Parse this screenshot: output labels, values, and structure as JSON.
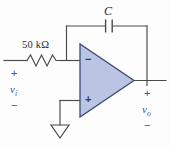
{
  "figure": {
    "background_color": "#fdfdfd"
  },
  "colors": {
    "wire": "#4a4a4a",
    "opamp_fill": "#b9c5e2",
    "opamp_stroke": "#3d4a78",
    "signal_label": "#4a4f9c",
    "component_label": "#2b2b2b"
  },
  "components": {
    "resistor": {
      "name": "input-resistor",
      "label": "50 kΩ",
      "value": "50",
      "unit": "kΩ"
    },
    "capacitor": {
      "name": "feedback-capacitor",
      "label": "C"
    },
    "opamp": {
      "name": "operational-amplifier",
      "inverting_input_symbol": "−",
      "noninverting_input_symbol": "+"
    },
    "ground": {
      "name": "ground-symbol",
      "label": ""
    }
  },
  "terminals": {
    "input": {
      "signal": "v",
      "subscript": "i",
      "plus": "+",
      "minus": "−"
    },
    "output": {
      "signal": "v",
      "subscript": "o",
      "plus": "+",
      "minus": "−"
    }
  }
}
